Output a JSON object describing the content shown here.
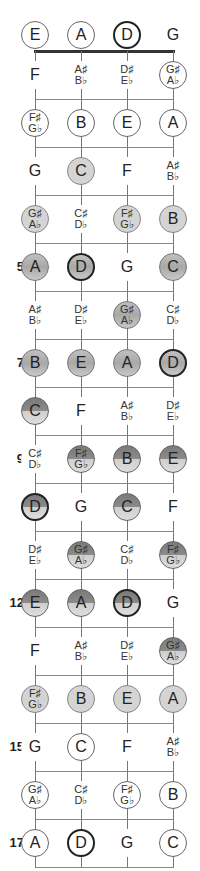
{
  "diagram": {
    "strings": [
      "E",
      "A",
      "D",
      "G"
    ],
    "string_x": [
      35,
      81,
      127,
      173
    ],
    "root_note": "D",
    "fret_markers": {
      "5": "5",
      "7": "7",
      "9": "9",
      "12": "12",
      "15": "15",
      "17": "17"
    },
    "rows": [
      {
        "fret": 0,
        "notes": [
          {
            "n": "E",
            "style": "outline"
          },
          {
            "n": "A",
            "style": "outline"
          },
          {
            "n": "D",
            "style": "root"
          },
          {
            "n": "G",
            "style": "plain"
          }
        ]
      },
      {
        "fret": 1,
        "notes": [
          {
            "n": "F",
            "style": "plain"
          },
          {
            "n": "A♯",
            "n2": "B♭",
            "style": "plain"
          },
          {
            "n": "D♯",
            "n2": "E♭",
            "style": "plain"
          },
          {
            "n": "G♯",
            "n2": "A♭",
            "style": "outline"
          }
        ]
      },
      {
        "fret": 2,
        "notes": [
          {
            "n": "F♯",
            "n2": "G♭",
            "style": "outline"
          },
          {
            "n": "B",
            "style": "outline"
          },
          {
            "n": "E",
            "style": "outline"
          },
          {
            "n": "A",
            "style": "outline"
          }
        ]
      },
      {
        "fret": 3,
        "notes": [
          {
            "n": "G",
            "style": "plain"
          },
          {
            "n": "C",
            "style": "light"
          },
          {
            "n": "F",
            "style": "plain"
          },
          {
            "n": "A♯",
            "n2": "B♭",
            "style": "plain"
          }
        ]
      },
      {
        "fret": 4,
        "notes": [
          {
            "n": "G♯",
            "n2": "A♭",
            "style": "light"
          },
          {
            "n": "C♯",
            "n2": "D♭",
            "style": "plain"
          },
          {
            "n": "F♯",
            "n2": "G♭",
            "style": "light"
          },
          {
            "n": "B",
            "style": "light"
          }
        ]
      },
      {
        "fret": 5,
        "label": "5",
        "notes": [
          {
            "n": "A",
            "style": "mid"
          },
          {
            "n": "D",
            "style": "mid-root"
          },
          {
            "n": "G",
            "style": "plain"
          },
          {
            "n": "C",
            "style": "mid"
          }
        ]
      },
      {
        "fret": 6,
        "notes": [
          {
            "n": "A♯",
            "n2": "B♭",
            "style": "plain"
          },
          {
            "n": "D♯",
            "n2": "E♭",
            "style": "plain"
          },
          {
            "n": "G♯",
            "n2": "A♭",
            "style": "mid"
          },
          {
            "n": "C♯",
            "n2": "D♭",
            "style": "plain"
          }
        ]
      },
      {
        "fret": 7,
        "label": "7",
        "notes": [
          {
            "n": "B",
            "style": "mid"
          },
          {
            "n": "E",
            "style": "mid"
          },
          {
            "n": "A",
            "style": "mid"
          },
          {
            "n": "D",
            "style": "mid-root"
          }
        ]
      },
      {
        "fret": 8,
        "notes": [
          {
            "n": "C",
            "style": "split"
          },
          {
            "n": "F",
            "style": "plain"
          },
          {
            "n": "A♯",
            "n2": "B♭",
            "style": "plain"
          },
          {
            "n": "D♯",
            "n2": "E♭",
            "style": "plain"
          }
        ]
      },
      {
        "fret": 9,
        "label": "9",
        "notes": [
          {
            "n": "C♯",
            "n2": "D♭",
            "style": "plain"
          },
          {
            "n": "F♯",
            "n2": "G♭",
            "style": "split"
          },
          {
            "n": "B",
            "style": "split"
          },
          {
            "n": "E",
            "style": "split"
          }
        ]
      },
      {
        "fret": 10,
        "notes": [
          {
            "n": "D",
            "style": "split-root"
          },
          {
            "n": "G",
            "style": "plain"
          },
          {
            "n": "C",
            "style": "split"
          },
          {
            "n": "F",
            "style": "plain"
          }
        ]
      },
      {
        "fret": 11,
        "notes": [
          {
            "n": "D♯",
            "n2": "E♭",
            "style": "plain"
          },
          {
            "n": "G♯",
            "n2": "A♭",
            "style": "split"
          },
          {
            "n": "C♯",
            "n2": "D♭",
            "style": "plain"
          },
          {
            "n": "F♯",
            "n2": "G♭",
            "style": "split"
          }
        ]
      },
      {
        "fret": 12,
        "label": "12",
        "notes": [
          {
            "n": "E",
            "style": "split"
          },
          {
            "n": "A",
            "style": "split"
          },
          {
            "n": "D",
            "style": "split-root"
          },
          {
            "n": "G",
            "style": "plain"
          }
        ]
      },
      {
        "fret": 13,
        "notes": [
          {
            "n": "F",
            "style": "plain"
          },
          {
            "n": "A♯",
            "n2": "B♭",
            "style": "plain"
          },
          {
            "n": "D♯",
            "n2": "E♭",
            "style": "plain"
          },
          {
            "n": "G♯",
            "n2": "A♭",
            "style": "split"
          }
        ]
      },
      {
        "fret": 14,
        "notes": [
          {
            "n": "F♯",
            "n2": "G♭",
            "style": "light"
          },
          {
            "n": "B",
            "style": "light"
          },
          {
            "n": "E",
            "style": "light"
          },
          {
            "n": "A",
            "style": "light"
          }
        ]
      },
      {
        "fret": 15,
        "label": "15",
        "notes": [
          {
            "n": "G",
            "style": "plain"
          },
          {
            "n": "C",
            "style": "outline"
          },
          {
            "n": "F",
            "style": "plain"
          },
          {
            "n": "A♯",
            "n2": "B♭",
            "style": "plain"
          }
        ]
      },
      {
        "fret": 16,
        "notes": [
          {
            "n": "G♯",
            "n2": "A♭",
            "style": "outline"
          },
          {
            "n": "C♯",
            "n2": "D♭",
            "style": "plain"
          },
          {
            "n": "F♯",
            "n2": "G♭",
            "style": "outline"
          },
          {
            "n": "B",
            "style": "outline"
          }
        ]
      },
      {
        "fret": 17,
        "label": "17",
        "notes": [
          {
            "n": "A",
            "style": "outline"
          },
          {
            "n": "D",
            "style": "root"
          },
          {
            "n": "G",
            "style": "plain"
          },
          {
            "n": "C",
            "style": "outline"
          }
        ]
      }
    ]
  }
}
